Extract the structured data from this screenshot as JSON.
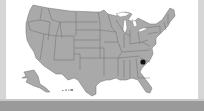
{
  "map": {
    "title": "",
    "region": "United States",
    "highlighted_state": "South Carolina",
    "highlight_marker": {
      "x": 143,
      "y": 62,
      "color": "#111111"
    },
    "colors": {
      "state_fill": "#a9a9a9",
      "state_border": "#6e6e6e",
      "background": "#ffffff",
      "frame": "#d6d6d6",
      "bottom_bar": "#9a9a9a",
      "highlight": "#111111"
    },
    "insets": [
      "Alaska",
      "Hawaii"
    ]
  }
}
